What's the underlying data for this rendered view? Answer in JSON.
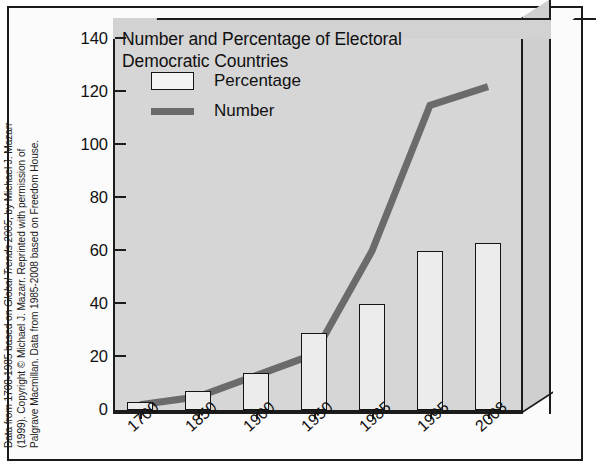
{
  "caption": {
    "line1_a": "Data from 1700-1985 based on ",
    "line1_i": "Global Trends 2005",
    "line1_b": ", by Michael J. Mazarr",
    "line2": "(1999). Copyright © Michael J. Mazarr. Reprinted with permission of",
    "line3": "Palgrave Macmillan. Data from 1985-2008 based on Freedom House."
  },
  "chart_data": {
    "type": "bar",
    "title": "Number and Percentage of Electoral Democratic Countries",
    "title_line1": "Number and Percentage of Electoral",
    "title_line2": "Democratic Countries",
    "categories": [
      "1700",
      "1850",
      "1900",
      "1950",
      "1985",
      "1995",
      "2008"
    ],
    "series": [
      {
        "name": "Percentage",
        "type": "bar",
        "values": [
          3,
          7,
          14,
          29,
          40,
          60,
          63
        ],
        "color": "#ececec",
        "edge_color": "#141414"
      },
      {
        "name": "Number",
        "type": "line",
        "values": [
          2,
          5,
          13,
          21,
          60,
          115,
          122
        ],
        "color": "#6b6b6b"
      }
    ],
    "xlabel": "",
    "ylabel": "",
    "ylim": [
      0,
      140
    ],
    "yticks": [
      0,
      20,
      40,
      60,
      80,
      100,
      120,
      140
    ],
    "ytick_labels": [
      "0",
      "20",
      "40",
      "60",
      "80",
      "100",
      "120",
      "140"
    ],
    "grid": false,
    "legend_position": "upper-left",
    "legend_entries": [
      "Percentage",
      "Number"
    ],
    "style": "3d-box",
    "background_color": "#d6d6d6",
    "frame_color": "#1c1c1c"
  }
}
